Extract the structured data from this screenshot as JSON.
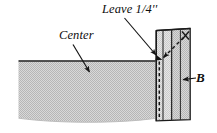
{
  "figure": {
    "type": "line-diagram",
    "width": 217,
    "height": 133,
    "background": "#ffffff",
    "ink_color": "#141414",
    "fabric_fill": "#c9c9c9"
  },
  "labels": {
    "leave": "Leave 1/4''",
    "center": "Center",
    "strip_b": "B"
  },
  "annotations": [
    {
      "name": "leave-seam-allowance-callout",
      "text": "Leave 1/4''",
      "leader": "solid-line-arrow",
      "points_to": "top-of-seam-at-strip-edge"
    },
    {
      "name": "center-panel-callout",
      "text": "Center",
      "leader": "solid-line-arrow",
      "points_to": "center-fabric-panel"
    },
    {
      "name": "strip-b-callout",
      "text": "B",
      "leader": "solid-line-arrow",
      "points_to": "border-strip-b"
    },
    {
      "name": "stop-stitching-marker",
      "text": "",
      "leader": "dashed-line-arrow",
      "marker": "x-cross",
      "points_to": "seam-start-point"
    }
  ],
  "shapes": {
    "center_panel": {
      "name": "center-fabric-panel",
      "fill": "#c9c9c9",
      "top_edge_y": 61,
      "left_edge_x": 18,
      "right_edge_x": 155,
      "bottom_edge": "curved"
    },
    "strip_b": {
      "name": "border-strip-b",
      "fill": "#c9c9c9",
      "top_y": 28,
      "left_x": 155,
      "right_x": 190,
      "seam_line": "dashed-vertical",
      "fold_lines": 3
    }
  },
  "colors": {
    "fabric": "#c9c9c9",
    "fabric_light": "#dedede",
    "line": "#141414",
    "text": "#0d0d0d",
    "paper": "#ffffff"
  }
}
